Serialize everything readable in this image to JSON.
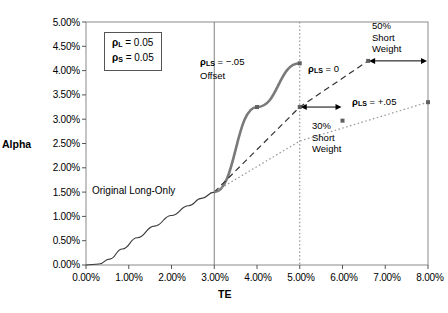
{
  "chart_data": {
    "type": "line",
    "title": "",
    "xlabel": "TE",
    "ylabel": "Alpha",
    "xlim": [
      0,
      8
    ],
    "ylim": [
      0,
      5
    ],
    "grid": false,
    "legend_position": "inline-annotations",
    "xtick_labels": [
      "0.00%",
      "1.00%",
      "2.00%",
      "3.00%",
      "4.00%",
      "5.00%",
      "6.00%",
      "7.00%",
      "8.00%"
    ],
    "xtick_values": [
      0,
      1,
      2,
      3,
      4,
      5,
      6,
      7,
      8
    ],
    "ytick_labels": [
      "0.00%",
      "0.50%",
      "1.00%",
      "1.50%",
      "2.00%",
      "2.50%",
      "3.00%",
      "3.50%",
      "4.00%",
      "4.50%",
      "5.00%"
    ],
    "ytick_values": [
      0,
      0.5,
      1.0,
      1.5,
      2.0,
      2.5,
      3.0,
      3.5,
      4.0,
      4.5,
      5.0
    ],
    "series": [
      {
        "name": "Original Long-Only",
        "style": "solid-thin",
        "color": "#3a3a3a",
        "points": [
          [
            0,
            0
          ],
          [
            0.3,
            0.02
          ],
          [
            0.55,
            0.12
          ],
          [
            0.85,
            0.33
          ],
          [
            1.2,
            0.56
          ],
          [
            1.6,
            0.8
          ],
          [
            2.0,
            1.02
          ],
          [
            2.4,
            1.22
          ],
          [
            2.7,
            1.37
          ],
          [
            3.0,
            1.5
          ]
        ]
      },
      {
        "name": "rho_LS = -.05 Offset",
        "style": "solid-thick",
        "color": "#7a7a7a",
        "points": [
          [
            3.0,
            1.5
          ],
          [
            4.0,
            3.25
          ],
          [
            5.0,
            4.15
          ]
        ]
      },
      {
        "name": "rho_LS = 0",
        "style": "dashed",
        "color": "#333333",
        "points": [
          [
            3.0,
            1.5
          ],
          [
            5.0,
            3.25
          ],
          [
            6.6,
            4.2
          ]
        ]
      },
      {
        "name": "rho_LS = +.05",
        "style": "dotted",
        "color": "#999999",
        "points": [
          [
            3.0,
            1.5
          ],
          [
            5.0,
            2.55
          ],
          [
            8.0,
            3.35
          ]
        ]
      }
    ],
    "markers": [
      {
        "series": "rho_LS = -.05 Offset",
        "x": 4.0,
        "y": 3.25
      },
      {
        "series": "rho_LS = -.05 Offset",
        "x": 5.0,
        "y": 4.15
      },
      {
        "series": "rho_LS = 0",
        "x": 5.0,
        "y": 3.25
      },
      {
        "series": "rho_LS = 0",
        "x": 6.6,
        "y": 4.2
      },
      {
        "series": "rho_LS = +.05",
        "x": 6.0,
        "y": 2.97
      },
      {
        "series": "rho_LS = +.05",
        "x": 8.0,
        "y": 3.35
      }
    ],
    "reference_lines": [
      {
        "name": "te-3pct-solid",
        "x": 3.0,
        "style": "solid",
        "color": "#808080"
      },
      {
        "name": "te-5pct-dotted",
        "x": 5.0,
        "style": "dotted",
        "color": "#808080"
      }
    ],
    "arrows": [
      {
        "name": "30-percent-short-weight-arrow",
        "from_x": 5.0,
        "to_x": 6.0,
        "y": 3.25,
        "label": "30%\nShort\nWeight"
      },
      {
        "name": "50-percent-short-weight-arrow",
        "from_x": 6.6,
        "to_x": 8.0,
        "y": 4.2,
        "label": "50%\nShort\nWeight"
      }
    ]
  },
  "axis": {
    "y_title": "Alpha",
    "x_title": "TE"
  },
  "legend_box": {
    "rho_long_label": "ρ",
    "rho_long_sub": "L",
    "rho_long_value": " = 0.05",
    "rho_short_label": "ρ",
    "rho_short_sub": "S",
    "rho_short_value": " = 0.05"
  },
  "annotations": {
    "offset_line1_rho": "ρ",
    "offset_line1_sub": "LS",
    "offset_line1_value": " = −.05",
    "offset_line2": "Offset",
    "zero_rho": "ρ",
    "zero_sub": "LS",
    "zero_value": " = 0",
    "plus_rho": "ρ",
    "plus_sub": "LS",
    "plus_value": " = +.05",
    "long_only": "Original  Long-Only",
    "short30_l1": "30%",
    "short30_l2": "Short",
    "short30_l3": "Weight",
    "short50_l1": "50%",
    "short50_l2": "Short",
    "short50_l3": "Weight"
  },
  "ticks": {
    "y": [
      "5.00%",
      "4.50%",
      "4.00%",
      "3.50%",
      "3.00%",
      "2.50%",
      "2.00%",
      "1.50%",
      "1.00%",
      "0.50%",
      "0.00%"
    ],
    "x": [
      "0.00%",
      "1.00%",
      "2.00%",
      "3.00%",
      "4.00%",
      "5.00%",
      "6.00%",
      "7.00%",
      "8.00%"
    ]
  }
}
